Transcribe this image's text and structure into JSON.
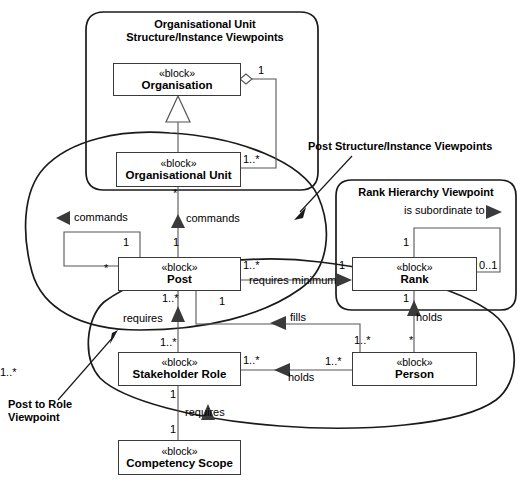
{
  "diagram": {
    "stereotype": "«block»",
    "viewpoints": [
      {
        "id": "org-unit",
        "label_line1": "Organisational Unit",
        "label_line2": "Structure/Instance  Viewpoints"
      },
      {
        "id": "rank-hierarchy",
        "label_line1": "Rank Hierarchy Viewpoint",
        "label_line2": ""
      },
      {
        "id": "post-structure",
        "label_line1": "Post Structure/Instance Viewpoints",
        "label_line2": ""
      },
      {
        "id": "post-to-role",
        "label_line1": "Post to Role",
        "label_line2": "Viewpoint"
      }
    ],
    "blocks": [
      {
        "id": "organisation",
        "stereotype": "«block»",
        "name": "Organisation"
      },
      {
        "id": "organisational-unit",
        "stereotype": "«block»",
        "name": "Organisational Unit"
      },
      {
        "id": "post",
        "stereotype": "«block»",
        "name": "Post"
      },
      {
        "id": "rank",
        "stereotype": "«block»",
        "name": "Rank"
      },
      {
        "id": "stakeholder-role",
        "stereotype": "«block»",
        "name": "Stakeholder Role"
      },
      {
        "id": "person",
        "stereotype": "«block»",
        "name": "Person"
      },
      {
        "id": "competency-scope",
        "stereotype": "«block»",
        "name": "Competency Scope"
      }
    ],
    "relationships": [
      {
        "id": "org-aggregates-ou",
        "source": "organisation",
        "target": "organisational-unit",
        "type": "aggregation",
        "label": "",
        "source_mult": "1",
        "target_mult": "1..*"
      },
      {
        "id": "org-generalises-ou",
        "source": "organisational-unit",
        "target": "organisation",
        "type": "generalization",
        "label": "",
        "source_mult": "",
        "target_mult": ""
      },
      {
        "id": "ou-commands-post",
        "source": "organisational-unit",
        "target": "post",
        "type": "association",
        "label": "commands",
        "source_mult": "*",
        "target_mult": "1"
      },
      {
        "id": "post-commands-post",
        "source": "post",
        "target": "post",
        "type": "association",
        "label": "commands",
        "source_mult": "*",
        "target_mult": "1"
      },
      {
        "id": "post-requires-minimum-rank",
        "source": "post",
        "target": "rank",
        "type": "association",
        "label": "requires minimum",
        "source_mult": "1..*",
        "target_mult": "1"
      },
      {
        "id": "rank-subordinate-rank",
        "source": "rank",
        "target": "rank",
        "type": "association",
        "label": "is subordinate to",
        "source_mult": "1",
        "target_mult": "0..1"
      },
      {
        "id": "person-holds-rank",
        "source": "person",
        "target": "rank",
        "type": "association",
        "label": "holds",
        "source_mult": "*",
        "target_mult": "1"
      },
      {
        "id": "person-fills-post",
        "source": "person",
        "target": "post",
        "type": "association",
        "label": "fills",
        "source_mult": "1..*",
        "target_mult": "1"
      },
      {
        "id": "post-requires-role",
        "source": "post",
        "target": "stakeholder-role",
        "type": "association",
        "label": "requires",
        "source_mult": "1..*",
        "target_mult": "1..*"
      },
      {
        "id": "person-holds-role",
        "source": "person",
        "target": "stakeholder-role",
        "type": "association",
        "label": "holds",
        "source_mult": "1..*",
        "target_mult": "1..*"
      },
      {
        "id": "role-requires-competency",
        "source": "stakeholder-role",
        "target": "competency-scope",
        "type": "association",
        "label": "requires",
        "source_mult": "1",
        "target_mult": "1"
      }
    ],
    "edge_labels": {
      "commands_left": "commands",
      "commands_mid": "commands",
      "requires_minimum": "requires minimum",
      "is_subordinate_to": "is subordinate to",
      "holds_rank": "holds",
      "fills": "fills",
      "requires_role": "requires",
      "holds_role": "holds",
      "requires_competency": "requires"
    },
    "multiplicities": {
      "org_one": "1",
      "ou_many": "1..*",
      "ou_star": "*",
      "post_left_star": "*",
      "post_top_one_a": "1",
      "post_top_one_b": "1",
      "post_right_many": "1..*",
      "post_bottom_many": "1..*",
      "post_fills_one": "1",
      "rank_left_one": "1",
      "rank_top_one": "1",
      "rank_right_zeroone": "0..1",
      "rank_bottom_one": "1",
      "role_top_many": "1..*",
      "role_right_many": "1..*",
      "role_bottom_one": "1",
      "person_top_star": "*",
      "person_topleft_many": "1..*",
      "person_left_many": "1..*",
      "person_far_many": "1..*",
      "competency_top_one": "1"
    },
    "colors": {
      "stroke": "#3a3a3a",
      "line": "#555555",
      "outline": "#1a1a1a",
      "text": "#000000",
      "background": "#ffffff"
    }
  }
}
